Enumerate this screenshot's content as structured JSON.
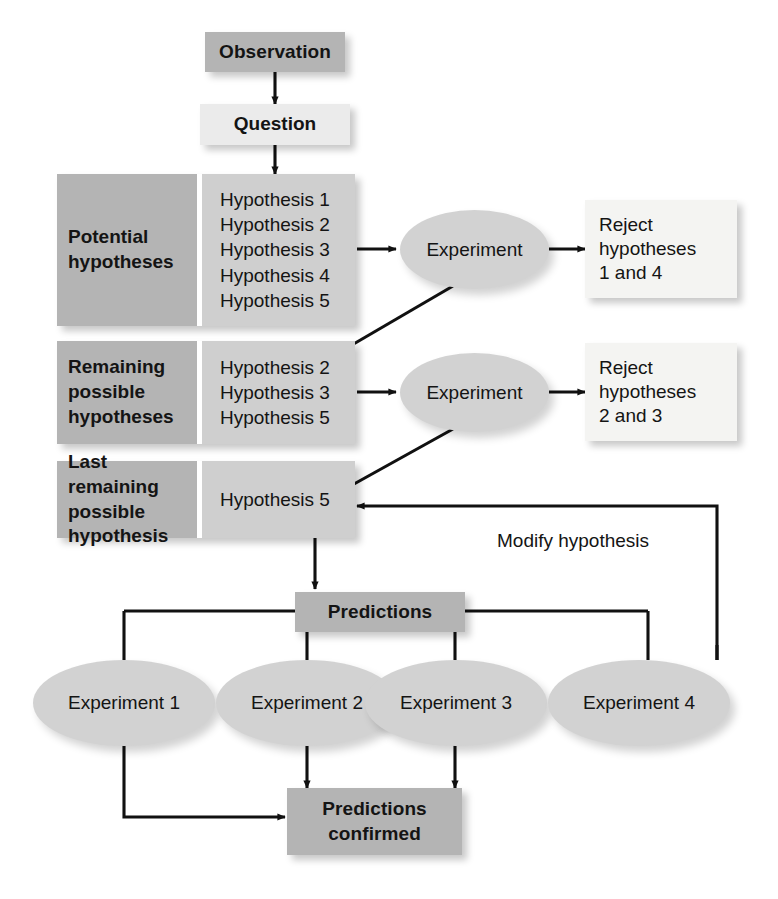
{
  "diagram": {
    "colors": {
      "dark_panel": "#b4b4b4",
      "light_panel": "#cfcfcf",
      "pale_box": "#ebebeb",
      "white_box": "#f4f4f2",
      "ellipse": "#d2d2d2",
      "line": "#111111",
      "text": "#141414",
      "background": "#ffffff"
    },
    "start": {
      "observation_label": "Observation",
      "question_label": "Question"
    },
    "rows": [
      {
        "id": "potential",
        "label": "Potential\nhypotheses",
        "label_lines": [
          "Potential",
          "hypotheses"
        ],
        "hypotheses": [
          "Hypothesis 1",
          "Hypothesis 2",
          "Hypothesis 3",
          "Hypothesis 4",
          "Hypothesis 5"
        ],
        "experiment_label": "Experiment",
        "outcome_lines": [
          "Reject",
          "hypotheses",
          "1 and 4"
        ]
      },
      {
        "id": "remaining",
        "label": "Remaining\npossible\nhypotheses",
        "label_lines": [
          "Remaining",
          "possible",
          "hypotheses"
        ],
        "hypotheses": [
          "Hypothesis 2",
          "Hypothesis 3",
          "Hypothesis 5"
        ],
        "experiment_label": "Experiment",
        "outcome_lines": [
          "Reject",
          "hypotheses",
          "2 and 3"
        ]
      },
      {
        "id": "last",
        "label": "Last remaining\npossible\nhypothesis",
        "label_lines": [
          "Last remaining",
          "possible",
          "hypothesis"
        ],
        "hypotheses": [
          "Hypothesis 5"
        ],
        "experiment_label": "",
        "outcome_lines": []
      }
    ],
    "feedback": {
      "modify_label": "Modify hypothesis"
    },
    "predictions": {
      "label": "Predictions",
      "experiments": [
        "Experiment 1",
        "Experiment 2",
        "Experiment 3",
        "Experiment 4"
      ],
      "confirmed_lines": [
        "Predictions",
        "confirmed"
      ],
      "confirmed_label": "Predictions confirmed"
    }
  }
}
